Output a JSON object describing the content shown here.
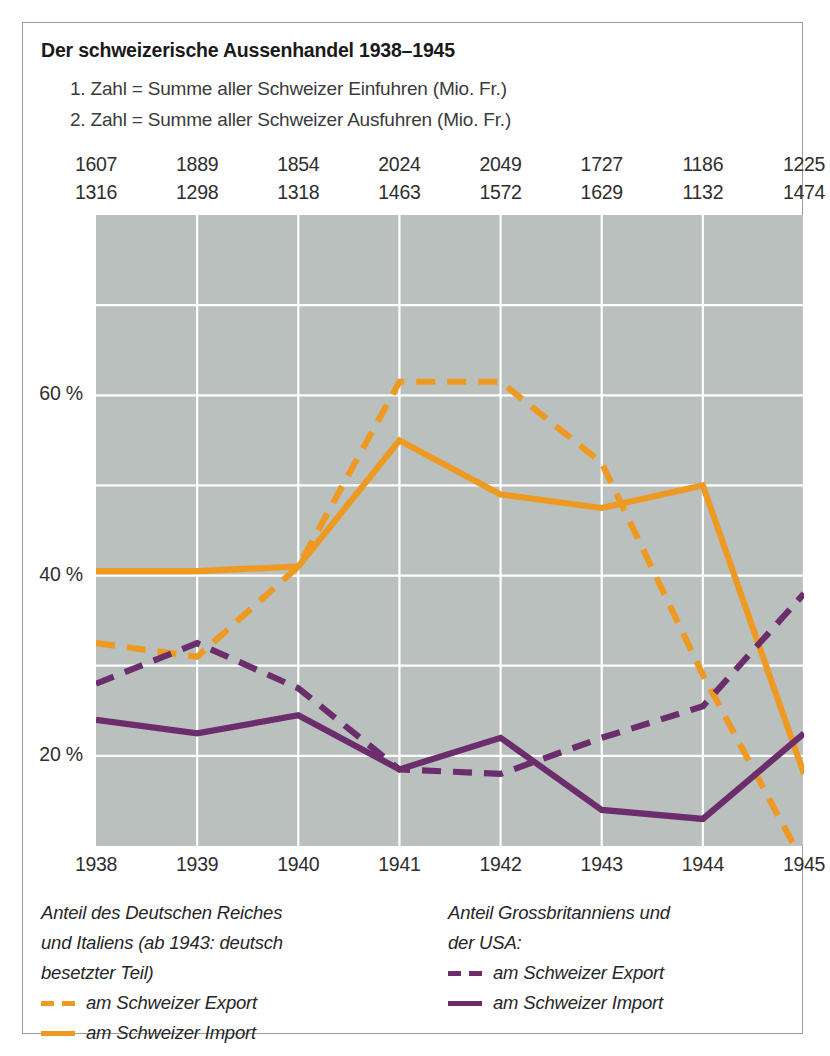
{
  "title": "Der schweizerische Aussenhandel 1938–1945",
  "subtitles": [
    "1. Zahl = Summe aller Schweizer Einfuhren (Mio. Fr.)",
    "2. Zahl = Summe aller Schweizer Ausfuhren (Mio. Fr.)"
  ],
  "colors": {
    "orange": "#ee9a22",
    "purple": "#6b2d6b",
    "plot_background": "#b9c0be",
    "gridline": "#ffffff",
    "frame_border": "#9b9b9b",
    "text": "#2e2e2e"
  },
  "axis": {
    "y_ticks": [
      "60 %",
      "40 %",
      "20 %"
    ],
    "y_tick_values": [
      60,
      40,
      20
    ],
    "ylim": [
      10,
      80
    ],
    "gridlines_y": [
      20,
      30,
      40,
      50,
      60,
      70
    ],
    "x_ticks": [
      "1938",
      "1939",
      "1940",
      "1941",
      "1942",
      "1943",
      "1944",
      "1945"
    ]
  },
  "legend_left": {
    "heading": [
      "Anteil des Deutschen Reiches",
      "und Italiens (ab 1943: deutsch",
      "besetzter Teil)"
    ],
    "entries": [
      {
        "style": "dashed",
        "color": "#ee9a22",
        "label": "am Schweizer Export"
      },
      {
        "style": "solid",
        "color": "#ee9a22",
        "label": "am Schweizer Import"
      }
    ]
  },
  "legend_right": {
    "heading": [
      "Anteil Grossbritanniens und",
      "der USA:"
    ],
    "entries": [
      {
        "style": "dashed",
        "color": "#6b2d6b",
        "label": "am Schweizer Export"
      },
      {
        "style": "solid",
        "color": "#6b2d6b",
        "label": "am Schweizer Import"
      }
    ]
  },
  "chart_data": {
    "type": "line",
    "title": "Der schweizerische Aussenhandel 1938–1945",
    "xlabel": "",
    "ylabel": "%",
    "x": [
      1938,
      1939,
      1940,
      1941,
      1942,
      1943,
      1944,
      1945
    ],
    "categories": [
      "1938",
      "1939",
      "1940",
      "1941",
      "1942",
      "1943",
      "1944",
      "1945"
    ],
    "ylim": [
      10,
      80
    ],
    "grid": true,
    "legend_position": "below-plot",
    "annotation_rows": [
      {
        "name": "Summe aller Schweizer Einfuhren (Mio. Fr.)",
        "values": [
          1607,
          1889,
          1854,
          2024,
          2049,
          1727,
          1186,
          1225
        ]
      },
      {
        "name": "Summe aller Schweizer Ausfuhren (Mio. Fr.)",
        "values": [
          1316,
          1298,
          1318,
          1463,
          1572,
          1629,
          1132,
          1474
        ]
      }
    ],
    "series": [
      {
        "name": "Deutsches Reich und Italien – am Schweizer Export",
        "color": "#ee9a22",
        "style": "dashed",
        "values": [
          32.5,
          31.0,
          41.0,
          61.5,
          61.5,
          52.5,
          29.0,
          8.0
        ]
      },
      {
        "name": "Deutsches Reich und Italien – am Schweizer Import",
        "color": "#ee9a22",
        "style": "solid",
        "values": [
          40.5,
          40.5,
          41.0,
          55.0,
          49.0,
          47.5,
          50.0,
          18.0
        ]
      },
      {
        "name": "Grossbritannien und USA – am Schweizer Export",
        "color": "#6b2d6b",
        "style": "dashed",
        "values": [
          28.0,
          32.5,
          27.5,
          18.5,
          18.0,
          22.0,
          25.5,
          38.0
        ]
      },
      {
        "name": "Grossbritannien und USA – am Schweizer Import",
        "color": "#6b2d6b",
        "style": "solid",
        "values": [
          24.0,
          22.5,
          24.5,
          18.5,
          22.0,
          14.0,
          13.0,
          22.5
        ]
      }
    ]
  }
}
